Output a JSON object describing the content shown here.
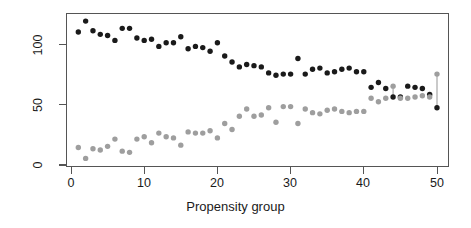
{
  "chart_data": {
    "type": "scatter",
    "title": "",
    "xlabel": "Propensity group",
    "ylabel": "Households",
    "xlim": [
      0,
      52
    ],
    "ylim": [
      -2,
      126
    ],
    "xticks": [
      0,
      10,
      20,
      30,
      40,
      50
    ],
    "yticks": [
      0,
      50,
      100
    ],
    "grid": false,
    "legend": "none",
    "x": [
      1,
      2,
      3,
      4,
      5,
      6,
      7,
      8,
      9,
      10,
      11,
      12,
      13,
      14,
      15,
      16,
      17,
      18,
      19,
      20,
      21,
      22,
      23,
      24,
      25,
      26,
      27,
      28,
      29,
      30,
      31,
      32,
      33,
      34,
      35,
      36,
      37,
      38,
      39,
      40,
      41,
      42,
      43,
      44,
      45,
      46,
      47,
      48,
      49,
      50
    ],
    "series": [
      {
        "name": "dark-series",
        "color": "#1a1a1a",
        "marker": "filled-circle",
        "values": [
          110,
          119,
          111,
          108,
          107,
          103,
          113,
          113,
          105,
          103,
          104,
          98,
          101,
          101,
          106,
          96,
          98,
          97,
          94,
          101,
          90,
          85,
          81,
          83,
          82,
          81,
          76,
          74,
          75,
          75,
          88,
          75,
          79,
          80,
          76,
          77,
          79,
          80,
          77,
          77,
          64,
          68,
          63,
          56,
          56,
          65,
          64,
          63,
          58,
          47
        ]
      },
      {
        "name": "light-series",
        "color": "#9e9e9e",
        "marker": "filled-circle",
        "values": [
          14,
          5,
          13,
          12,
          15,
          21,
          11,
          10,
          21,
          23,
          18,
          26,
          23,
          22,
          16,
          27,
          26,
          26,
          28,
          22,
          34,
          29,
          40,
          46,
          40,
          41,
          47,
          35,
          48,
          48,
          34,
          46,
          43,
          42,
          45,
          46,
          44,
          43,
          44,
          44,
          55,
          52,
          55,
          65,
          55,
          55,
          56,
          57,
          56,
          75
        ]
      }
    ],
    "connectors": [
      {
        "x": 44,
        "y_low": 56,
        "y_high": 65
      },
      {
        "x": 50,
        "y_low": 47,
        "y_high": 75
      }
    ]
  },
  "axis": {
    "x_tick_labels": [
      "0",
      "10",
      "20",
      "30",
      "40",
      "50"
    ],
    "y_tick_labels": [
      "0",
      "50",
      "100"
    ]
  }
}
